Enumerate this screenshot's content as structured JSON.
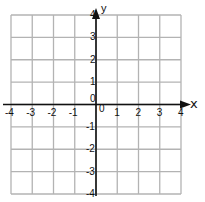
{
  "diagram": {
    "type": "coordinate-grid",
    "x_axis": {
      "label": "x",
      "min": -4,
      "max": 4,
      "ticks": [
        "-4",
        "-3",
        "-2",
        "-1",
        "0",
        "1",
        "2",
        "3",
        "4"
      ]
    },
    "y_axis": {
      "label": "y",
      "min": -4,
      "max": 4,
      "ticks": [
        "-4",
        "-3",
        "-2",
        "-1",
        "0",
        "1",
        "2",
        "3",
        "4"
      ]
    },
    "grid_color": "#b3b3b3",
    "axis_color": "#111111"
  },
  "labels": {
    "x_axis_name": "x",
    "y_axis_name": "y",
    "x_ticks": [
      {
        "text": "-4",
        "value": -4
      },
      {
        "text": "-3",
        "value": -3
      },
      {
        "text": "-2",
        "value": -2
      },
      {
        "text": "-1",
        "value": -1
      },
      {
        "text": "0",
        "value": 0
      },
      {
        "text": "1",
        "value": 1
      },
      {
        "text": "2",
        "value": 2
      },
      {
        "text": "3",
        "value": 3
      },
      {
        "text": "4",
        "value": 4
      }
    ],
    "y_ticks": [
      {
        "text": "4",
        "value": 4
      },
      {
        "text": "3",
        "value": 3
      },
      {
        "text": "2",
        "value": 2
      },
      {
        "text": "1",
        "value": 1
      },
      {
        "text": "0",
        "value": 0
      },
      {
        "text": "-1",
        "value": -1
      },
      {
        "text": "-2",
        "value": -2
      },
      {
        "text": "-3",
        "value": -3
      },
      {
        "text": "-4",
        "value": -4
      }
    ]
  }
}
